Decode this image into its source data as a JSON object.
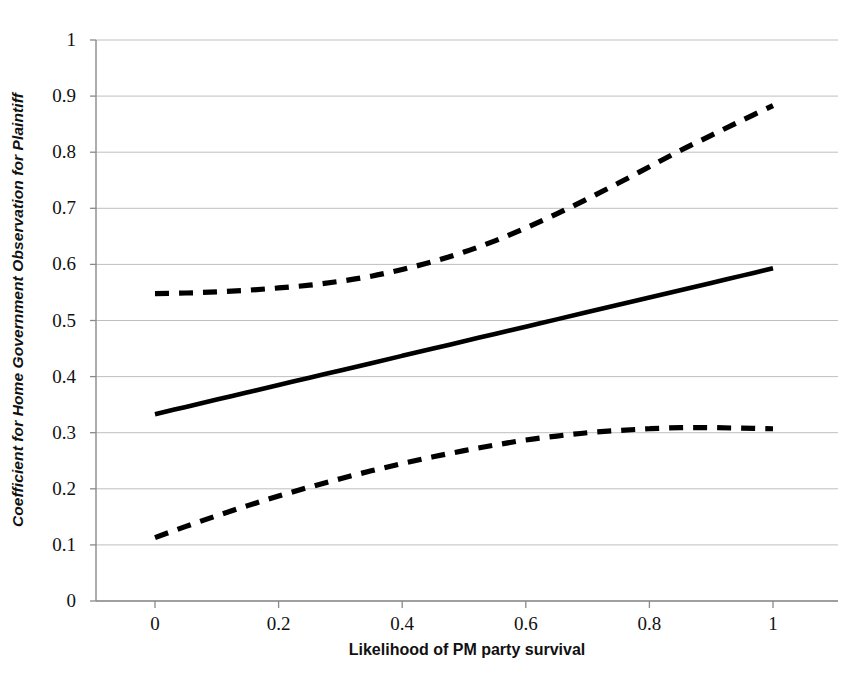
{
  "chart_data": {
    "type": "line",
    "title": "",
    "xlabel": "Likelihood of PM party survival",
    "ylabel": "Coefficient for Home Government Observation for Plaintiff",
    "xlim": [
      0,
      1
    ],
    "ylim": [
      0,
      1
    ],
    "xticks": [
      "0",
      "0.2",
      "0.4",
      "0.6",
      "0.8",
      "1"
    ],
    "xtick_values": [
      0,
      0.2,
      0.4,
      0.6,
      0.8,
      1
    ],
    "yticks": [
      "0",
      "0.1",
      "0.2",
      "0.3",
      "0.4",
      "0.5",
      "0.6",
      "0.7",
      "0.8",
      "0.9",
      "1"
    ],
    "ytick_values": [
      0,
      0.1,
      0.2,
      0.3,
      0.4,
      0.5,
      0.6,
      0.7,
      0.8,
      0.9,
      1
    ],
    "grid": "horizontal",
    "legend": "none",
    "x": [
      0,
      0.05,
      0.1,
      0.15,
      0.2,
      0.25,
      0.3,
      0.35,
      0.4,
      0.45,
      0.5,
      0.55,
      0.6,
      0.65,
      0.7,
      0.75,
      0.8,
      0.85,
      0.9,
      0.95,
      1
    ],
    "series": [
      {
        "name": "Upper 95% confidence bound",
        "style": "dashed",
        "color": "#000000",
        "values": [
          0.548,
          0.549,
          0.551,
          0.554,
          0.558,
          0.563,
          0.57,
          0.579,
          0.591,
          0.605,
          0.622,
          0.642,
          0.665,
          0.69,
          0.717,
          0.745,
          0.774,
          0.803,
          0.83,
          0.857,
          0.883
        ]
      },
      {
        "name": "Point estimate",
        "style": "solid",
        "color": "#000000",
        "values": [
          0.333,
          0.346,
          0.359,
          0.372,
          0.385,
          0.398,
          0.411,
          0.424,
          0.437,
          0.45,
          0.463,
          0.476,
          0.489,
          0.502,
          0.515,
          0.528,
          0.541,
          0.554,
          0.567,
          0.58,
          0.593
        ]
      },
      {
        "name": "Lower 95% confidence bound",
        "style": "dashed",
        "color": "#000000",
        "values": [
          0.113,
          0.133,
          0.152,
          0.17,
          0.187,
          0.203,
          0.218,
          0.232,
          0.245,
          0.257,
          0.268,
          0.278,
          0.287,
          0.294,
          0.3,
          0.304,
          0.307,
          0.309,
          0.309,
          0.308,
          0.307
        ]
      }
    ]
  },
  "caption": {
    "text": ""
  }
}
